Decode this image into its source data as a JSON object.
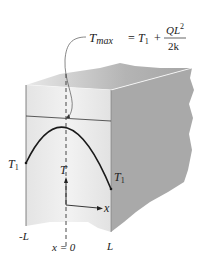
{
  "diagram": {
    "title_equation": {
      "lhs": "T",
      "lhs_sub": "max",
      "equals": "=",
      "t1_base": "T",
      "t1_sub": "1",
      "plus": "+",
      "numerator_Q": "QL",
      "numerator_sup": "2",
      "denominator": "2k"
    },
    "labels": {
      "T1_left_base": "T",
      "T1_left_sub": "1",
      "T1_right_base": "T",
      "T1_right_sub": "1",
      "T_axis": "T",
      "x_axis": "x",
      "neg_L": "-L",
      "x_zero": "x = 0",
      "pos_L": "L"
    },
    "colors": {
      "front_face": "#ececec",
      "top_face": "#c8c8c8",
      "side_face": "#a8a8a8",
      "curve": "#1a1a1a"
    }
  }
}
